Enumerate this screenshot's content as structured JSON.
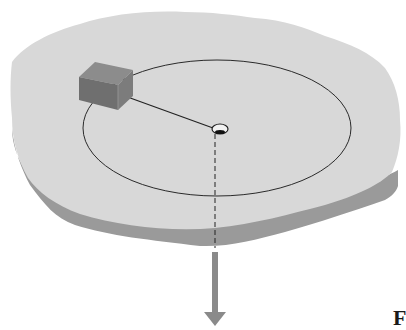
{
  "diagram": {
    "figure_label": "F",
    "colors": {
      "table_top": "#d8d8d8",
      "table_edge": "#9a9a9a",
      "block_top": "#8c8c8c",
      "block_front": "#6f6f6f",
      "block_side": "#7c7c7c",
      "circle_path": "#2a2a2a",
      "string": "#222222",
      "arrow": "#8a8a8a"
    },
    "elements": [
      {
        "id": "table",
        "label": "table surface"
      },
      {
        "id": "block",
        "label": "block"
      },
      {
        "id": "circular-path",
        "label": "circular path"
      },
      {
        "id": "string",
        "label": "string"
      },
      {
        "id": "hole",
        "label": "center hole"
      },
      {
        "id": "force-arrow",
        "label": "downward force"
      }
    ]
  }
}
